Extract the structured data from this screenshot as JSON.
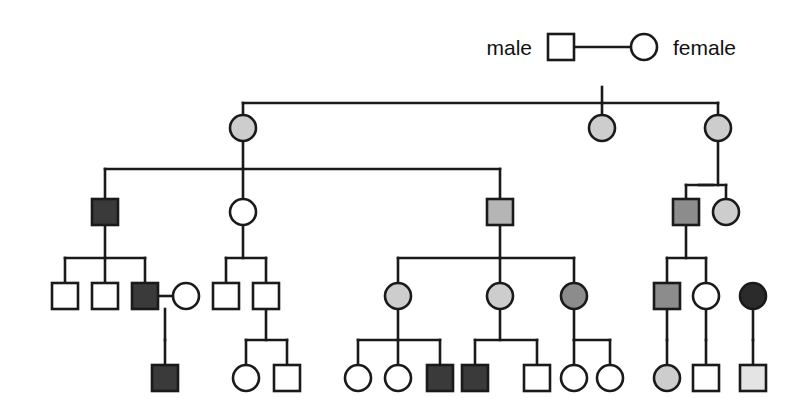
{
  "figure": {
    "kind": "pedigree-chart",
    "title": "",
    "width": 811,
    "height": 419,
    "background": "#ffffff",
    "line_color": "#1a1a1a",
    "line_width": 2.6,
    "symbol_size": 26,
    "shape_meanings": {
      "square": "male",
      "circle": "female"
    },
    "fill_shades": {
      "white": "#ffffff",
      "very_light_gray": "#e4e4e4",
      "light_gray": "#cdcdcd",
      "medium_gray": "#b5b5b5",
      "dark_gray": "#8c8c8c",
      "very_dark_gray": "#3a3a3a",
      "black": "#2b2b2b"
    }
  },
  "legend": {
    "male_label": "male",
    "female_label": "female",
    "male_symbol": "square-symbol",
    "female_symbol": "circle-symbol"
  },
  "chart_data": {
    "type": "diagram",
    "diagram_type": "pedigree",
    "generations": 5,
    "nodes": [
      {
        "id": "I-1",
        "gen": 1,
        "shape": "square",
        "fill": "white",
        "cx": 561,
        "cy": 47,
        "label": "male"
      },
      {
        "id": "I-2",
        "gen": 1,
        "shape": "circle",
        "fill": "white",
        "cx": 644,
        "cy": 47,
        "label": "female"
      },
      {
        "id": "II-1",
        "gen": 2,
        "shape": "circle",
        "fill": "light_gray",
        "cx": 243,
        "cy": 128,
        "label": ""
      },
      {
        "id": "II-2",
        "gen": 2,
        "shape": "circle",
        "fill": "light_gray",
        "cx": 602,
        "cy": 128,
        "label": ""
      },
      {
        "id": "II-3",
        "gen": 2,
        "shape": "circle",
        "fill": "light_gray",
        "cx": 718,
        "cy": 128,
        "label": ""
      },
      {
        "id": "III-1",
        "gen": 3,
        "shape": "square",
        "fill": "very_dark_gray",
        "cx": 105,
        "cy": 212,
        "label": ""
      },
      {
        "id": "III-2",
        "gen": 3,
        "shape": "circle",
        "fill": "white",
        "cx": 243,
        "cy": 212,
        "label": ""
      },
      {
        "id": "III-3",
        "gen": 3,
        "shape": "square",
        "fill": "medium_gray",
        "cx": 500,
        "cy": 212,
        "label": ""
      },
      {
        "id": "III-4",
        "gen": 3,
        "shape": "square",
        "fill": "dark_gray",
        "cx": 686,
        "cy": 212,
        "label": ""
      },
      {
        "id": "III-5",
        "gen": 3,
        "shape": "circle",
        "fill": "light_gray",
        "cx": 726,
        "cy": 212,
        "label": ""
      },
      {
        "id": "IV-1",
        "gen": 4,
        "shape": "square",
        "fill": "white",
        "cx": 65,
        "cy": 296,
        "label": ""
      },
      {
        "id": "IV-2",
        "gen": 4,
        "shape": "square",
        "fill": "white",
        "cx": 105,
        "cy": 296,
        "label": ""
      },
      {
        "id": "IV-3",
        "gen": 4,
        "shape": "square",
        "fill": "very_dark_gray",
        "cx": 145,
        "cy": 296,
        "label": ""
      },
      {
        "id": "IV-4",
        "gen": 4,
        "shape": "circle",
        "fill": "white",
        "cx": 186,
        "cy": 296,
        "label": ""
      },
      {
        "id": "IV-5",
        "gen": 4,
        "shape": "square",
        "fill": "white",
        "cx": 226,
        "cy": 296,
        "label": ""
      },
      {
        "id": "IV-6",
        "gen": 4,
        "shape": "square",
        "fill": "white",
        "cx": 266,
        "cy": 296,
        "label": ""
      },
      {
        "id": "IV-7",
        "gen": 4,
        "shape": "circle",
        "fill": "light_gray",
        "cx": 398,
        "cy": 296,
        "label": ""
      },
      {
        "id": "IV-8",
        "gen": 4,
        "shape": "circle",
        "fill": "light_gray",
        "cx": 500,
        "cy": 296,
        "label": ""
      },
      {
        "id": "IV-9",
        "gen": 4,
        "shape": "circle",
        "fill": "dark_gray",
        "cx": 574,
        "cy": 296,
        "label": ""
      },
      {
        "id": "IV-10",
        "gen": 4,
        "shape": "square",
        "fill": "dark_gray",
        "cx": 667,
        "cy": 296,
        "label": ""
      },
      {
        "id": "IV-11",
        "gen": 4,
        "shape": "circle",
        "fill": "white",
        "cx": 706,
        "cy": 296,
        "label": ""
      },
      {
        "id": "IV-12",
        "gen": 4,
        "shape": "circle",
        "fill": "black",
        "cx": 753,
        "cy": 296,
        "label": ""
      },
      {
        "id": "V-1",
        "gen": 5,
        "shape": "square",
        "fill": "very_dark_gray",
        "cx": 165,
        "cy": 378,
        "label": ""
      },
      {
        "id": "V-2",
        "gen": 5,
        "shape": "circle",
        "fill": "white",
        "cx": 246,
        "cy": 378,
        "label": ""
      },
      {
        "id": "V-3",
        "gen": 5,
        "shape": "square",
        "fill": "white",
        "cx": 287,
        "cy": 378,
        "label": ""
      },
      {
        "id": "V-4",
        "gen": 5,
        "shape": "circle",
        "fill": "white",
        "cx": 358,
        "cy": 378,
        "label": ""
      },
      {
        "id": "V-5",
        "gen": 5,
        "shape": "circle",
        "fill": "white",
        "cx": 398,
        "cy": 378,
        "label": ""
      },
      {
        "id": "V-6",
        "gen": 5,
        "shape": "square",
        "fill": "very_dark_gray",
        "cx": 440,
        "cy": 378,
        "label": ""
      },
      {
        "id": "V-7",
        "gen": 5,
        "shape": "square",
        "fill": "very_dark_gray",
        "cx": 475,
        "cy": 378,
        "label": ""
      },
      {
        "id": "V-8",
        "gen": 5,
        "shape": "square",
        "fill": "white",
        "cx": 537,
        "cy": 378,
        "label": ""
      },
      {
        "id": "V-9",
        "gen": 5,
        "shape": "circle",
        "fill": "white",
        "cx": 574,
        "cy": 378,
        "label": ""
      },
      {
        "id": "V-10",
        "gen": 5,
        "shape": "circle",
        "fill": "white",
        "cx": 610,
        "cy": 378,
        "label": ""
      },
      {
        "id": "V-11",
        "gen": 5,
        "shape": "circle",
        "fill": "light_gray",
        "cx": 667,
        "cy": 378,
        "label": ""
      },
      {
        "id": "V-12",
        "gen": 5,
        "shape": "square",
        "fill": "white",
        "cx": 706,
        "cy": 378,
        "label": ""
      },
      {
        "id": "V-13",
        "gen": 5,
        "shape": "square",
        "fill": "very_light_gray",
        "cx": 753,
        "cy": 378,
        "label": ""
      }
    ],
    "matings": [
      {
        "id": "M1",
        "partners": [
          "I-1",
          "I-2"
        ],
        "y": 47,
        "drop_x": 602
      },
      {
        "id": "M2",
        "partners": [
          "IV-3",
          "IV-4"
        ],
        "y": 296,
        "drop_x": 165
      },
      {
        "id": "M3",
        "partners": [
          "III-4",
          "III-5"
        ],
        "y": 185,
        "drop_x": 686
      }
    ],
    "sibships": [
      {
        "id": "S1",
        "parents_drop_x": 602,
        "from_y": 87,
        "to_y": 103,
        "children": [
          "II-1",
          "II-2",
          "II-3"
        ]
      },
      {
        "id": "S2",
        "parents_drop_x": 243,
        "from_y": 141,
        "to_y": 169,
        "children": [
          "III-1",
          "III-2",
          "III-3"
        ]
      },
      {
        "id": "S3",
        "parents_drop_x": 718,
        "from_y": 141,
        "to_y": 185,
        "children": [
          "III-4",
          "III-5"
        ]
      },
      {
        "id": "S4",
        "parents_drop_x": 105,
        "from_y": 225,
        "to_y": 258,
        "children": [
          "IV-1",
          "IV-2",
          "IV-3"
        ]
      },
      {
        "id": "S5",
        "parents_drop_x": 243,
        "from_y": 225,
        "to_y": 258,
        "children": [
          "IV-5",
          "IV-6"
        ]
      },
      {
        "id": "S6",
        "parents_drop_x": 500,
        "from_y": 225,
        "to_y": 258,
        "children": [
          "IV-7",
          "IV-8",
          "IV-9"
        ]
      },
      {
        "id": "S7",
        "parents_drop_x": 686,
        "from_y": 225,
        "to_y": 258,
        "children": [
          "IV-10",
          "IV-11"
        ]
      },
      {
        "id": "S8",
        "parents_drop_x": 165,
        "from_y": 309,
        "to_y": 340,
        "children": [
          "V-1"
        ]
      },
      {
        "id": "S9",
        "parents_drop_x": 266,
        "from_y": 309,
        "to_y": 340,
        "children": [
          "V-2",
          "V-3"
        ]
      },
      {
        "id": "S10",
        "parents_drop_x": 398,
        "from_y": 309,
        "to_y": 340,
        "children": [
          "V-4",
          "V-5",
          "V-6"
        ]
      },
      {
        "id": "S11",
        "parents_drop_x": 500,
        "from_y": 309,
        "to_y": 340,
        "children": [
          "V-7",
          "V-8"
        ]
      },
      {
        "id": "S12",
        "parents_drop_x": 574,
        "from_y": 309,
        "to_y": 340,
        "children": [
          "V-9",
          "V-10"
        ]
      },
      {
        "id": "S13",
        "parents_drop_x": 667,
        "from_y": 309,
        "to_y": 340,
        "children": [
          "V-11"
        ]
      },
      {
        "id": "S14",
        "parents_drop_x": 706,
        "from_y": 309,
        "to_y": 340,
        "children": [
          "V-12"
        ]
      },
      {
        "id": "S15",
        "parents_drop_x": 753,
        "from_y": 309,
        "to_y": 340,
        "children": [
          "V-13"
        ]
      }
    ]
  }
}
